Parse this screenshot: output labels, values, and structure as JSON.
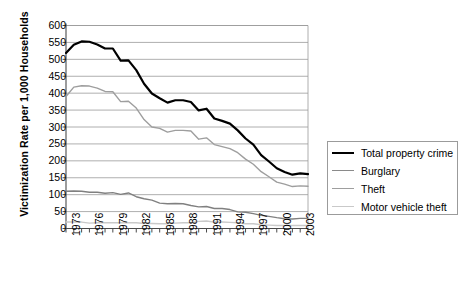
{
  "chart_data": {
    "type": "line",
    "title": "",
    "xlabel": "",
    "ylabel": "Victimization Rate per 1,000 Households",
    "ylim": [
      0,
      600
    ],
    "yticks": [
      0,
      50,
      100,
      150,
      200,
      250,
      300,
      350,
      400,
      450,
      500,
      550,
      600
    ],
    "xlim": [
      1973,
      2004
    ],
    "grid": true,
    "legend_position": "right",
    "x": [
      1973,
      1974,
      1975,
      1976,
      1977,
      1978,
      1979,
      1980,
      1981,
      1982,
      1983,
      1984,
      1985,
      1986,
      1987,
      1988,
      1989,
      1990,
      1991,
      1992,
      1993,
      1994,
      1995,
      1996,
      1997,
      1998,
      1999,
      2000,
      2001,
      2002,
      2003,
      2004
    ],
    "xtick_labels": [
      "1973",
      "1976",
      "1979",
      "1982",
      "1985",
      "1988",
      "1991",
      "1994",
      "1997",
      "2000",
      "2003"
    ],
    "series": [
      {
        "name": "Total property crime",
        "color": "#000000",
        "width": 2.2,
        "values": [
          519,
          543,
          553,
          552,
          544,
          532,
          532,
          496,
          497,
          468,
          428,
          399,
          385,
          372,
          379,
          379,
          374,
          349,
          354,
          325,
          318,
          310,
          290,
          266,
          248,
          217,
          198,
          178,
          167,
          159,
          163,
          161
        ]
      },
      {
        "name": "Burglary",
        "color": "#808080",
        "width": 1.4,
        "values": [
          110,
          111,
          110,
          107,
          107,
          104,
          106,
          101,
          105,
          94,
          88,
          84,
          75,
          73,
          74,
          73,
          68,
          64,
          65,
          59,
          59,
          56,
          49,
          48,
          44,
          39,
          36,
          32,
          29,
          28,
          30,
          30
        ]
      },
      {
        "name": "Theft",
        "color": "#9e9e9e",
        "width": 1.4,
        "values": [
          390,
          418,
          422,
          421,
          415,
          405,
          404,
          375,
          376,
          356,
          322,
          300,
          296,
          285,
          290,
          290,
          288,
          264,
          268,
          248,
          242,
          236,
          224,
          205,
          190,
          168,
          153,
          137,
          131,
          124,
          126,
          125
        ]
      },
      {
        "name": "Motor vehicle theft",
        "color": "#c9c9c9",
        "width": 1.4,
        "values": [
          19,
          19,
          19,
          16,
          17,
          17,
          17,
          17,
          17,
          17,
          15,
          15,
          14,
          14,
          16,
          17,
          17,
          21,
          22,
          19,
          19,
          18,
          17,
          14,
          14,
          11,
          10,
          9,
          9,
          9,
          9,
          9
        ]
      }
    ]
  },
  "axis": {
    "y_title": "Victimization Rate per 1,000 Households"
  },
  "legend": {
    "items": [
      {
        "label": "Total property crime"
      },
      {
        "label": "Burglary"
      },
      {
        "label": "Theft"
      },
      {
        "label": "Motor vehicle theft"
      }
    ]
  }
}
